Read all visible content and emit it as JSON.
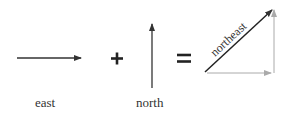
{
  "diagram": {
    "labels": {
      "east": "east",
      "north": "north",
      "northeast": "northeast"
    },
    "operators": {
      "plus": "+",
      "equals": "="
    },
    "colors": {
      "arrow": "#333333",
      "guide": "#aaaaaa",
      "text": "#333333"
    }
  }
}
